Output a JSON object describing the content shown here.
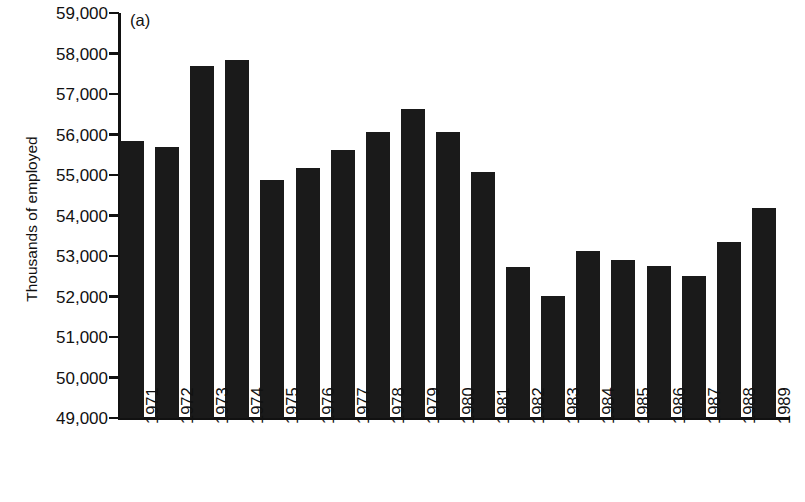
{
  "chart_data": {
    "type": "bar",
    "title": "",
    "panel_label": "(a)",
    "xlabel": "",
    "ylabel": "Thousands of employed",
    "ylim": [
      49000,
      59000
    ],
    "ytick_step": 1000,
    "grid": false,
    "legend": "none",
    "bar_color": "#1a1a1a",
    "axis_color": "#111111",
    "background": "#ffffff",
    "ytick_labels": [
      "59,000",
      "58,000",
      "57,000",
      "56,000",
      "55,000",
      "54,000",
      "53,000",
      "52,000",
      "51,000",
      "50,000",
      "49,000"
    ],
    "yticks": [
      59000,
      58000,
      57000,
      56000,
      55000,
      54000,
      53000,
      52000,
      51000,
      50000,
      49000
    ],
    "categories": [
      "1971",
      "1972",
      "1973",
      "1974",
      "1975",
      "1976",
      "1977",
      "1978",
      "1979",
      "1980",
      "1981",
      "1982",
      "1983",
      "1984",
      "1985",
      "1986",
      "1987",
      "1988",
      "1989"
    ],
    "values": [
      55850,
      55680,
      57700,
      57850,
      54880,
      55170,
      55620,
      56060,
      56640,
      56050,
      55080,
      52730,
      52020,
      53130,
      52900,
      52760,
      52500,
      53340,
      54180
    ]
  }
}
